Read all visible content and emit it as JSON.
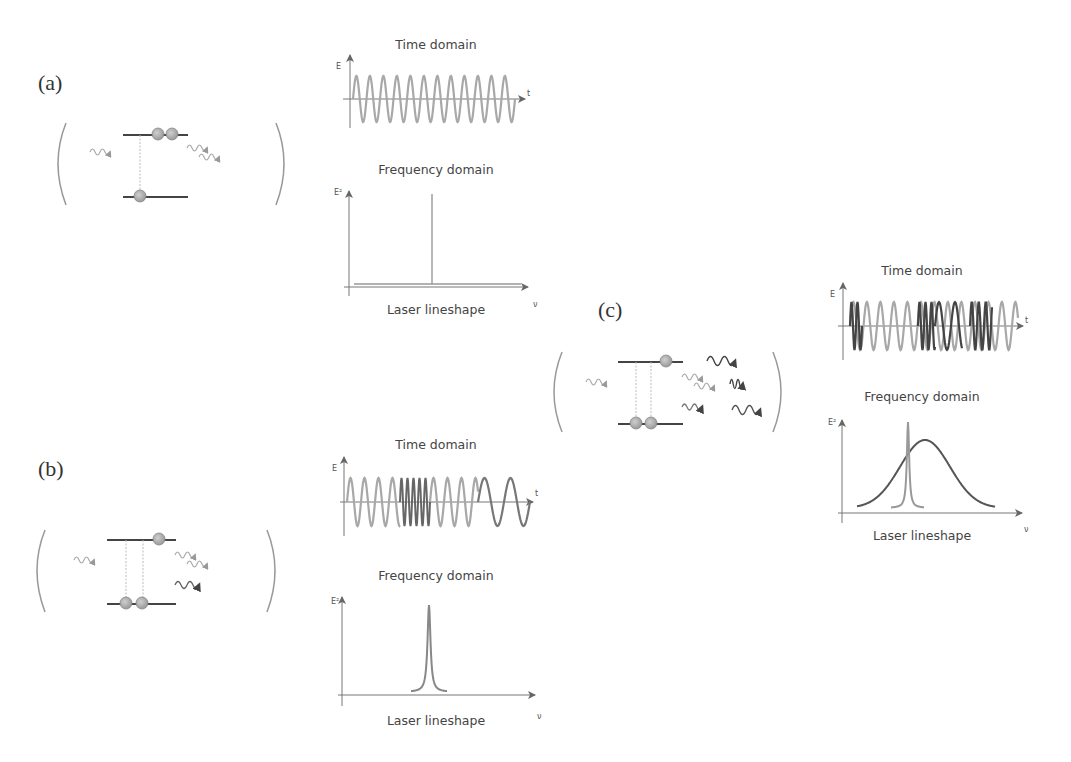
{
  "panels": {
    "a": {
      "label": "(a)",
      "time_title": "Time domain",
      "freq_title": "Frequency domain",
      "freq_caption": "Laser lineshape",
      "axis_E": "E",
      "axis_t": "t",
      "axis_E2": "E²",
      "axis_nu": "ν",
      "atom": {
        "upper_level_atoms": 2,
        "lower_level_atoms": 1,
        "transitions": 1,
        "incoming_photons": 1,
        "outgoing_photons": 2
      }
    },
    "b": {
      "label": "(b)",
      "time_title": "Time domain",
      "freq_title": "Frequency domain",
      "freq_caption": "Laser lineshape",
      "axis_E": "E",
      "axis_t": "t",
      "axis_E2": "E²",
      "axis_nu": "ν",
      "atom": {
        "upper_level_atoms": 1,
        "lower_level_atoms": 2,
        "transitions": 2,
        "incoming_photons": 1,
        "outgoing_photons": 3
      }
    },
    "c": {
      "label": "(c)",
      "time_title": "Time domain",
      "freq_title": "Frequency domain",
      "freq_caption": "Laser lineshape",
      "axis_E": "E",
      "axis_t": "t",
      "axis_E2": "E²",
      "axis_nu": "ν",
      "atom": {
        "upper_level_atoms": 1,
        "lower_level_atoms": 2,
        "transitions": 2,
        "incoming_photons": 1,
        "outgoing_photons": 6
      }
    }
  },
  "colors": {
    "light_wave": "#a8a8a8",
    "dark_wave": "#555555",
    "axis": "#777777",
    "level": "#444444",
    "atom_fill": "#b5b5b5"
  }
}
